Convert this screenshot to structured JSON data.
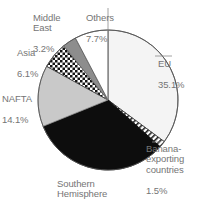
{
  "chart_data": {
    "type": "pie",
    "title": "",
    "subtitle": "",
    "xlabel": "",
    "ylabel": "",
    "legend_position": "none",
    "grid": false,
    "units": "percent",
    "start_angle_deg": 0,
    "direction": "clockwise",
    "categories": [
      "EU",
      "Banana-exporting countries",
      "Southern Hemisphere",
      "NAFTA",
      "Asia",
      "Middle East",
      "Others"
    ],
    "values": [
      35.1,
      1.5,
      32.2,
      14.1,
      6.1,
      3.2,
      7.7
    ],
    "slices": [
      {
        "name": "EU",
        "value": 35.1,
        "value_text": "35.1%",
        "label_text": "EU",
        "fill": "#f4f4f4",
        "pattern": "solid",
        "stroke": "#555555"
      },
      {
        "name": "Banana-exporting countries",
        "value": 1.5,
        "value_text": "1.5%",
        "label_text": "Banana-\nexporting\ncountries",
        "fill": "#ffffff",
        "pattern": "diagonal-hatch",
        "stroke": "#333333"
      },
      {
        "name": "Southern Hemisphere",
        "value": 32.2,
        "value_text": "32.2%",
        "label_text": "Southern\nHemisphere",
        "fill": "#0d0d0d",
        "pattern": "solid",
        "stroke": "#0d0d0d"
      },
      {
        "name": "NAFTA",
        "value": 14.1,
        "value_text": "14.1%",
        "label_text": "NAFTA",
        "fill": "#c9c9c9",
        "pattern": "solid",
        "stroke": "#8a8a8a"
      },
      {
        "name": "Asia",
        "value": 6.1,
        "value_text": "6.1%",
        "label_text": "Asia",
        "fill": "#ffffff",
        "pattern": "checker",
        "stroke": "#333333"
      },
      {
        "name": "Middle East",
        "value": 3.2,
        "value_text": "3.2%",
        "label_text": "Middle\nEast",
        "fill": "#8d8d8d",
        "pattern": "solid",
        "stroke": "#6a6a6a"
      },
      {
        "name": "Others",
        "value": 7.7,
        "value_text": "7.7%",
        "label_text": "Others",
        "fill": "#ffffff",
        "pattern": "solid",
        "stroke": "#555555"
      }
    ],
    "label_color": "#757575",
    "outline_color": "#555555"
  }
}
